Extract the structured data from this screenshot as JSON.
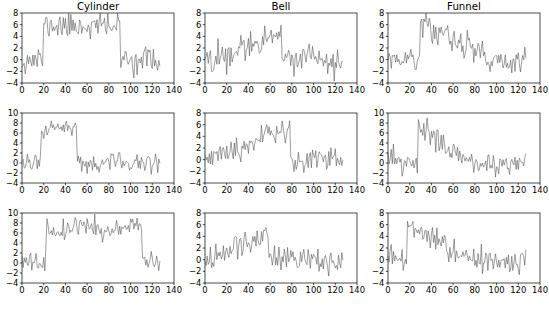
{
  "figure": {
    "title": "",
    "caption": "",
    "n_rows": 3,
    "n_cols": 3,
    "line_color": "#4d4d4d",
    "axis_color": "#000000",
    "background": "#ffffff"
  },
  "chart_data": [
    {
      "type": "line",
      "title": "Cylinder",
      "xlabel": "",
      "ylabel": "",
      "xlim": [
        0,
        140
      ],
      "ylim": [
        -4,
        8
      ],
      "xticks": [
        0,
        20,
        40,
        60,
        80,
        100,
        120,
        140
      ],
      "yticks": [
        -4,
        -2,
        0,
        2,
        4,
        6,
        8
      ],
      "grid": false,
      "legend": false,
      "pattern": "cylinder",
      "plateau_start": 20,
      "plateau_end": 90,
      "plateau_level": 5.8,
      "baseline_level": 0.0,
      "noise_amplitude": 1.1,
      "n_points": 128,
      "seed": 11
    },
    {
      "type": "line",
      "title": "Bell",
      "xlabel": "",
      "ylabel": "",
      "xlim": [
        0,
        140
      ],
      "ylim": [
        -4,
        8
      ],
      "xticks": [
        0,
        20,
        40,
        60,
        80,
        100,
        120,
        140
      ],
      "yticks": [
        -4,
        -2,
        0,
        2,
        4,
        6,
        8
      ],
      "grid": false,
      "legend": false,
      "pattern": "bell",
      "ramp_start": 10,
      "ramp_end": 70,
      "peak_level": 5.2,
      "baseline_level": 0.0,
      "noise_amplitude": 1.1,
      "n_points": 128,
      "seed": 22
    },
    {
      "type": "line",
      "title": "Funnel",
      "xlabel": "",
      "ylabel": "",
      "xlim": [
        0,
        140
      ],
      "ylim": [
        -4,
        8
      ],
      "xticks": [
        0,
        20,
        40,
        60,
        80,
        100,
        120,
        140
      ],
      "yticks": [
        -4,
        -2,
        0,
        2,
        4,
        6,
        8
      ],
      "grid": false,
      "legend": false,
      "pattern": "funnel",
      "jump_at": 30,
      "decay_end": 95,
      "peak_level": 6.4,
      "baseline_level": 0.0,
      "noise_amplitude": 1.1,
      "n_points": 128,
      "seed": 33
    },
    {
      "type": "line",
      "title": "",
      "xlabel": "",
      "ylabel": "",
      "xlim": [
        0,
        140
      ],
      "ylim": [
        -4,
        10
      ],
      "xticks": [
        0,
        20,
        40,
        60,
        80,
        100,
        120,
        140
      ],
      "yticks": [
        -4,
        -2,
        0,
        2,
        4,
        6,
        8,
        10
      ],
      "grid": false,
      "legend": false,
      "pattern": "cylinder",
      "plateau_start": 18,
      "plateau_end": 50,
      "plateau_level": 6.9,
      "baseline_level": 0.0,
      "noise_amplitude": 1.1,
      "n_points": 128,
      "seed": 44
    },
    {
      "type": "line",
      "title": "",
      "xlabel": "",
      "ylabel": "",
      "xlim": [
        0,
        140
      ],
      "ylim": [
        -4,
        8
      ],
      "xticks": [
        0,
        20,
        40,
        60,
        80,
        100,
        120,
        140
      ],
      "yticks": [
        -4,
        -2,
        0,
        2,
        4,
        6,
        8
      ],
      "grid": false,
      "legend": false,
      "pattern": "bell",
      "ramp_start": 8,
      "ramp_end": 78,
      "peak_level": 5.6,
      "baseline_level": 0.0,
      "noise_amplitude": 1.0,
      "n_points": 128,
      "seed": 55
    },
    {
      "type": "line",
      "title": "",
      "xlabel": "",
      "ylabel": "",
      "xlim": [
        0,
        140
      ],
      "ylim": [
        -4,
        10
      ],
      "xticks": [
        0,
        20,
        40,
        60,
        80,
        100,
        120,
        140
      ],
      "yticks": [
        -4,
        -2,
        0,
        2,
        4,
        6,
        8,
        10
      ],
      "grid": false,
      "legend": false,
      "pattern": "funnel",
      "jump_at": 28,
      "decay_end": 75,
      "peak_level": 7.6,
      "baseline_level": 0.0,
      "noise_amplitude": 1.1,
      "n_points": 128,
      "seed": 66
    },
    {
      "type": "line",
      "title": "",
      "xlabel": "",
      "ylabel": "",
      "xlim": [
        0,
        140
      ],
      "ylim": [
        -4,
        10
      ],
      "xticks": [
        0,
        20,
        40,
        60,
        80,
        100,
        120,
        140
      ],
      "yticks": [
        -4,
        -2,
        0,
        2,
        4,
        6,
        8,
        10
      ],
      "grid": false,
      "legend": false,
      "pattern": "cylinder",
      "plateau_start": 23,
      "plateau_end": 110,
      "plateau_level": 7.0,
      "baseline_level": 0.0,
      "noise_amplitude": 1.1,
      "n_points": 128,
      "seed": 77
    },
    {
      "type": "line",
      "title": "",
      "xlabel": "",
      "ylabel": "",
      "xlim": [
        0,
        140
      ],
      "ylim": [
        -4,
        8
      ],
      "xticks": [
        0,
        20,
        40,
        60,
        80,
        100,
        120,
        140
      ],
      "yticks": [
        -4,
        -2,
        0,
        2,
        4,
        6,
        8
      ],
      "grid": false,
      "legend": false,
      "pattern": "bell",
      "ramp_start": 6,
      "ramp_end": 58,
      "peak_level": 5.0,
      "baseline_level": 0.0,
      "noise_amplitude": 1.1,
      "n_points": 128,
      "seed": 88
    },
    {
      "type": "line",
      "title": "",
      "xlabel": "",
      "ylabel": "",
      "xlim": [
        0,
        140
      ],
      "ylim": [
        -4,
        8
      ],
      "xticks": [
        0,
        20,
        40,
        60,
        80,
        100,
        120,
        140
      ],
      "yticks": [
        -4,
        -2,
        0,
        2,
        4,
        6,
        8
      ],
      "grid": false,
      "legend": false,
      "pattern": "funnel",
      "jump_at": 18,
      "decay_end": 70,
      "peak_level": 6.4,
      "baseline_level": 0.0,
      "noise_amplitude": 1.1,
      "n_points": 128,
      "seed": 99
    }
  ]
}
